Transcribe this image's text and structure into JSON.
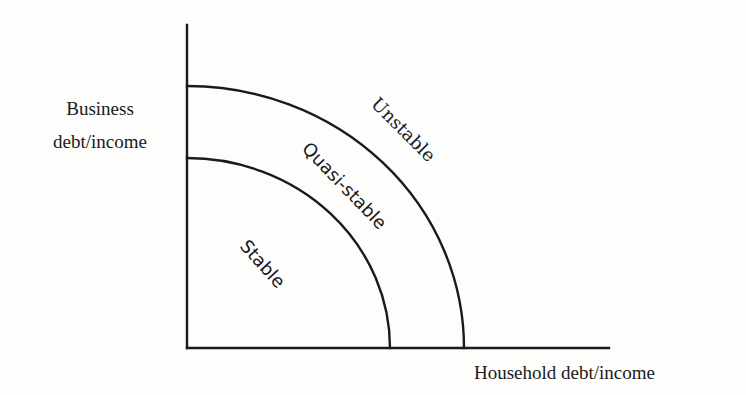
{
  "diagram": {
    "title": "",
    "y_axis": {
      "label_line1": "Business",
      "label_line2": "debt/income"
    },
    "x_axis": {
      "label": "Household debt/income"
    },
    "regions": [
      {
        "name": "stable",
        "label": "Stable"
      },
      {
        "name": "quasi-stable",
        "label": "Quasi-stable"
      },
      {
        "name": "unstable",
        "label": "Unstable"
      }
    ],
    "boundaries": [
      {
        "name": "inner-boundary",
        "separates": [
          "Stable",
          "Quasi-stable"
        ],
        "shape": "quarter-ellipse"
      },
      {
        "name": "outer-boundary",
        "separates": [
          "Quasi-stable",
          "Unstable"
        ],
        "shape": "quarter-ellipse"
      }
    ],
    "colors": {
      "ink": "#1a1a1a",
      "background": "#fdfdfc"
    }
  }
}
